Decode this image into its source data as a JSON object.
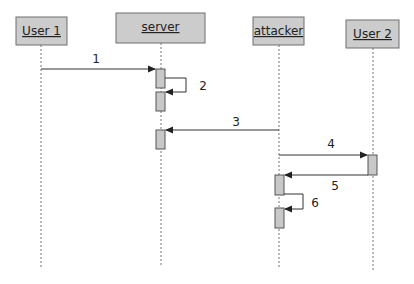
{
  "diagram": {
    "type": "sequence",
    "actors": [
      {
        "id": "user1",
        "label": "User 1"
      },
      {
        "id": "server",
        "label": "server"
      },
      {
        "id": "attacker",
        "label": "attacker"
      },
      {
        "id": "user2",
        "label": "User 2"
      }
    ],
    "messages": [
      {
        "label": "1",
        "from": "User 1",
        "to": "server"
      },
      {
        "label": "2",
        "from": "server",
        "to": "server"
      },
      {
        "label": "3",
        "from": "attacker",
        "to": "server"
      },
      {
        "label": "4",
        "from": "attacker",
        "to": "User 2"
      },
      {
        "label": "5",
        "from": "User 2",
        "to": "attacker"
      },
      {
        "label": "6",
        "from": "attacker",
        "to": "attacker"
      }
    ]
  }
}
